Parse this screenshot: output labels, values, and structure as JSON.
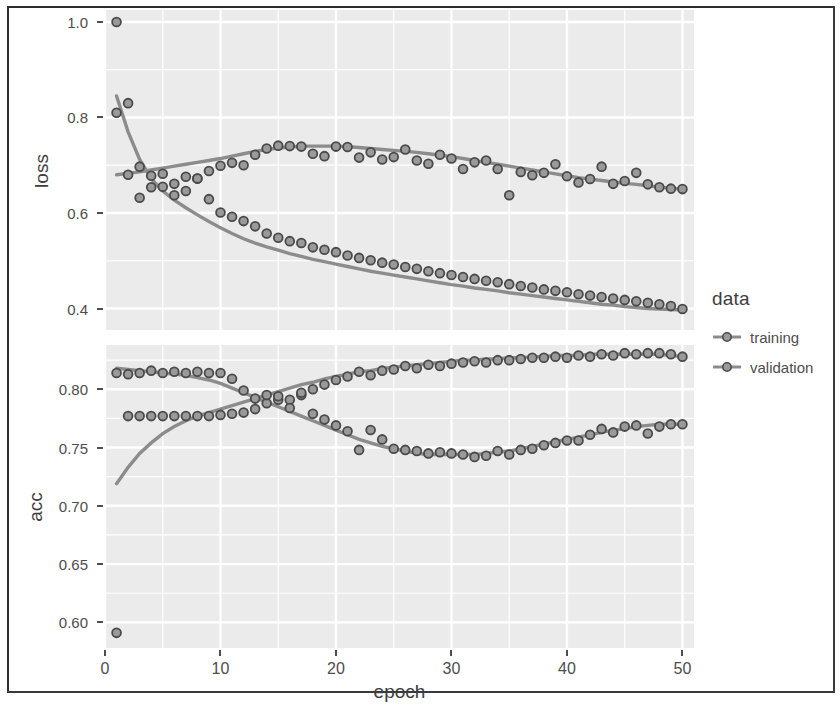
{
  "chart_data": {
    "type": "scatter",
    "title": "",
    "faceted": true,
    "facet_variable": "metric",
    "xlabel": "epoch",
    "x": [
      1,
      2,
      3,
      4,
      5,
      6,
      7,
      8,
      9,
      10,
      11,
      12,
      13,
      14,
      15,
      16,
      17,
      18,
      19,
      20,
      21,
      22,
      23,
      24,
      25,
      26,
      27,
      28,
      29,
      30,
      31,
      32,
      33,
      34,
      35,
      36,
      37,
      38,
      39,
      40,
      41,
      42,
      43,
      44,
      45,
      46,
      47,
      48,
      49,
      50
    ],
    "xlim": [
      0,
      51
    ],
    "x_ticks": [
      0,
      10,
      20,
      30,
      40,
      50
    ],
    "x_minor_gridlines": [
      5,
      15,
      25,
      35,
      45
    ],
    "grid": true,
    "legend_position": "right",
    "panel_background": "#ebebeb",
    "gridline_color": "#ffffff",
    "point_fill": "#9a9a9a",
    "point_stroke": "#4a4a4a",
    "smooth_line_color": "#8c8c8c",
    "panels": [
      {
        "name": "loss",
        "ylabel": "loss",
        "ylim": [
          0.355,
          1.025
        ],
        "y_ticks": [
          0.4,
          0.6,
          0.8,
          1.0
        ],
        "y_tick_labels": [
          "0.4",
          "0.6",
          "0.8",
          "1.0"
        ],
        "y_minor_gridlines": [
          0.5,
          0.7,
          0.9
        ],
        "series": [
          {
            "name": "training",
            "values": [
              1.0,
              0.83,
              0.632,
              0.678,
              0.655,
              0.637,
              0.646,
              0.672,
              0.629,
              0.601,
              0.592,
              0.583,
              0.572,
              0.557,
              0.548,
              0.541,
              0.537,
              0.528,
              0.523,
              0.518,
              0.511,
              0.506,
              0.501,
              0.496,
              0.492,
              0.487,
              0.483,
              0.478,
              0.474,
              0.47,
              0.466,
              0.462,
              0.458,
              0.455,
              0.451,
              0.447,
              0.444,
              0.44,
              0.437,
              0.434,
              0.43,
              0.427,
              0.424,
              0.421,
              0.418,
              0.415,
              0.412,
              0.409,
              0.405,
              0.399
            ],
            "smooth": [
              0.845,
              0.77,
              0.712,
              0.672,
              0.646,
              0.627,
              0.611,
              0.596,
              0.582,
              0.569,
              0.557,
              0.546,
              0.537,
              0.529,
              0.522,
              0.515,
              0.509,
              0.503,
              0.498,
              0.493,
              0.488,
              0.483,
              0.478,
              0.474,
              0.47,
              0.466,
              0.462,
              0.458,
              0.454,
              0.45,
              0.447,
              0.443,
              0.44,
              0.437,
              0.433,
              0.43,
              0.427,
              0.424,
              0.421,
              0.418,
              0.415,
              0.412,
              0.409,
              0.407,
              0.404,
              0.402,
              0.4,
              0.399,
              0.398,
              0.397
            ]
          },
          {
            "name": "validation",
            "values": [
              0.81,
              0.68,
              0.697,
              0.654,
              0.682,
              0.661,
              0.676,
              0.672,
              0.688,
              0.699,
              0.705,
              0.7,
              0.722,
              0.735,
              0.741,
              0.74,
              0.739,
              0.724,
              0.719,
              0.739,
              0.738,
              0.716,
              0.727,
              0.712,
              0.717,
              0.733,
              0.71,
              0.703,
              0.722,
              0.714,
              0.692,
              0.706,
              0.71,
              0.692,
              0.637,
              0.686,
              0.679,
              0.684,
              0.702,
              0.677,
              0.664,
              0.671,
              0.697,
              0.661,
              0.667,
              0.684,
              0.66,
              0.654,
              0.651,
              0.65
            ],
            "smooth": [
              0.68,
              0.683,
              0.686,
              0.69,
              0.694,
              0.698,
              0.702,
              0.706,
              0.71,
              0.714,
              0.719,
              0.724,
              0.729,
              0.733,
              0.736,
              0.738,
              0.74,
              0.74,
              0.74,
              0.74,
              0.739,
              0.737,
              0.735,
              0.733,
              0.731,
              0.729,
              0.727,
              0.724,
              0.721,
              0.718,
              0.714,
              0.71,
              0.706,
              0.702,
              0.698,
              0.694,
              0.69,
              0.686,
              0.682,
              0.678,
              0.674,
              0.671,
              0.668,
              0.665,
              0.662,
              0.66,
              0.657,
              0.654,
              0.652,
              0.65
            ]
          }
        ]
      },
      {
        "name": "acc",
        "ylabel": "acc",
        "ylim": [
          0.578,
          0.838
        ],
        "y_ticks": [
          0.6,
          0.65,
          0.7,
          0.75,
          0.8
        ],
        "y_tick_labels": [
          "0.60",
          "0.65",
          "0.70",
          "0.75",
          "0.80"
        ],
        "y_minor_gridlines": [
          0.625,
          0.675,
          0.725,
          0.775,
          0.825
        ],
        "series": [
          {
            "name": "training",
            "values": [
              0.591,
              0.777,
              0.777,
              0.777,
              0.777,
              0.777,
              0.777,
              0.777,
              0.777,
              0.778,
              0.779,
              0.78,
              0.783,
              0.788,
              0.791,
              0.791,
              0.795,
              0.8,
              0.804,
              0.808,
              0.811,
              0.815,
              0.812,
              0.816,
              0.817,
              0.82,
              0.818,
              0.821,
              0.82,
              0.822,
              0.823,
              0.824,
              0.823,
              0.825,
              0.825,
              0.826,
              0.827,
              0.827,
              0.828,
              0.827,
              0.829,
              0.828,
              0.83,
              0.829,
              0.831,
              0.83,
              0.831,
              0.831,
              0.83,
              0.828
            ],
            "smooth": [
              0.719,
              0.733,
              0.745,
              0.754,
              0.762,
              0.768,
              0.773,
              0.777,
              0.78,
              0.783,
              0.786,
              0.789,
              0.792,
              0.795,
              0.798,
              0.801,
              0.804,
              0.806,
              0.809,
              0.811,
              0.813,
              0.815,
              0.816,
              0.818,
              0.819,
              0.82,
              0.821,
              0.822,
              0.823,
              0.824,
              0.825,
              0.825,
              0.826,
              0.826,
              0.827,
              0.827,
              0.828,
              0.828,
              0.829,
              0.829,
              0.829,
              0.83,
              0.83,
              0.83,
              0.83,
              0.83,
              0.83,
              0.83,
              0.829,
              0.828
            ]
          },
          {
            "name": "validation",
            "values": [
              0.814,
              0.813,
              0.814,
              0.816,
              0.814,
              0.815,
              0.814,
              0.815,
              0.814,
              0.814,
              0.809,
              0.799,
              0.792,
              0.795,
              0.794,
              0.784,
              0.797,
              0.779,
              0.774,
              0.769,
              0.764,
              0.748,
              0.765,
              0.757,
              0.749,
              0.748,
              0.747,
              0.745,
              0.746,
              0.745,
              0.744,
              0.742,
              0.743,
              0.747,
              0.744,
              0.748,
              0.749,
              0.752,
              0.754,
              0.756,
              0.756,
              0.761,
              0.766,
              0.763,
              0.768,
              0.769,
              0.762,
              0.768,
              0.77,
              0.77
            ],
            "smooth": [
              0.818,
              0.817,
              0.816,
              0.815,
              0.814,
              0.813,
              0.812,
              0.81,
              0.808,
              0.805,
              0.801,
              0.797,
              0.793,
              0.789,
              0.785,
              0.781,
              0.777,
              0.773,
              0.769,
              0.765,
              0.761,
              0.757,
              0.754,
              0.751,
              0.749,
              0.747,
              0.745,
              0.744,
              0.744,
              0.744,
              0.744,
              0.744,
              0.745,
              0.746,
              0.747,
              0.749,
              0.751,
              0.753,
              0.755,
              0.757,
              0.759,
              0.761,
              0.763,
              0.765,
              0.766,
              0.768,
              0.769,
              0.77,
              0.77,
              0.77
            ]
          }
        ]
      }
    ]
  },
  "axes": {
    "x_title": "epoch",
    "x_tick_labels": [
      "0",
      "10",
      "20",
      "30",
      "40",
      "50"
    ],
    "loss_title": "loss",
    "acc_title": "acc"
  },
  "legend": {
    "title": "data",
    "items": [
      {
        "label": "training"
      },
      {
        "label": "validation"
      }
    ]
  }
}
